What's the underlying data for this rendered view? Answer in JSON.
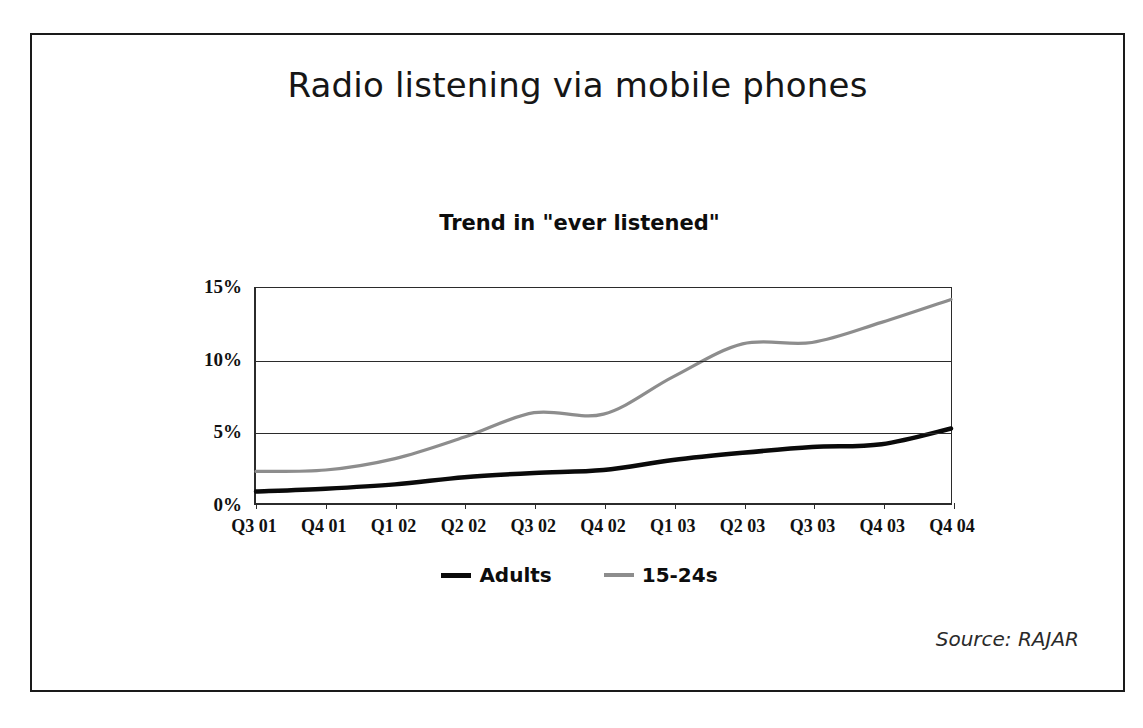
{
  "slide": {
    "title": "Radio listening via mobile phones",
    "source_note": "Source: RAJAR"
  },
  "chart_data": {
    "type": "line",
    "title": "Trend in \"ever listened\"",
    "xlabel": "",
    "ylabel": "",
    "ylim": [
      0,
      15
    ],
    "yticks": [
      "0%",
      "5%",
      "10%",
      "15%"
    ],
    "ytick_values": [
      0,
      5,
      10,
      15
    ],
    "grid": true,
    "legend_position": "bottom",
    "categories": [
      "Q3 01",
      "Q4 01",
      "Q1 02",
      "Q2 02",
      "Q3 02",
      "Q4 02",
      "Q1 03",
      "Q2 03",
      "Q3 03",
      "Q4 03",
      "Q4 04"
    ],
    "series": [
      {
        "name": "Adults",
        "color": "#0a0a0a",
        "style": "solid",
        "values": [
          0.8,
          1.0,
          1.3,
          1.8,
          2.1,
          2.3,
          3.0,
          3.5,
          3.9,
          4.1,
          5.2
        ]
      },
      {
        "name": "15-24s",
        "color": "#8d8d8d",
        "style": "solid-gray",
        "values": [
          2.2,
          2.3,
          3.1,
          4.6,
          6.3,
          6.2,
          8.8,
          11.1,
          11.2,
          12.6,
          14.2
        ]
      }
    ]
  },
  "legend": [
    {
      "label": "Adults"
    },
    {
      "label": "15-24s"
    }
  ]
}
